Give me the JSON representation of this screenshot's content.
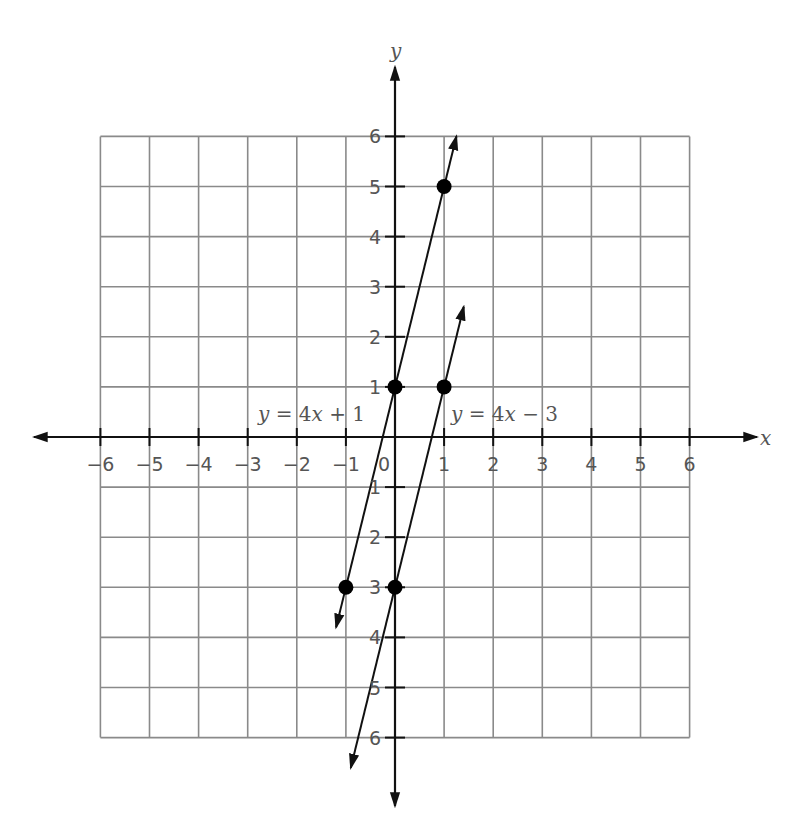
{
  "chart_data": {
    "type": "line",
    "title": "",
    "xlabel": "x",
    "ylabel": "y",
    "xlim": [
      -6,
      6
    ],
    "ylim": [
      -6,
      6
    ],
    "grid": true,
    "x_ticks": [
      -6,
      -5,
      -4,
      -3,
      -2,
      -1,
      0,
      1,
      2,
      3,
      4,
      5,
      6
    ],
    "x_tick_labels": [
      "−6",
      "−5",
      "−4",
      "−3",
      "−2",
      "−1",
      "0",
      "1",
      "2",
      "3",
      "4",
      "5",
      "6"
    ],
    "y_ticks": [
      6,
      5,
      4,
      3,
      2,
      1,
      -1,
      -2,
      -3,
      -4,
      -5,
      -6
    ],
    "y_tick_labels": [
      "6",
      "5",
      "4",
      "3",
      "2",
      "1",
      "1",
      "2",
      "3",
      "4",
      "5",
      "6"
    ],
    "series": [
      {
        "name": "y = 4x + 1",
        "equation": "y = 4x + 1",
        "slope": 4,
        "intercept": 1,
        "points": [
          [
            -1,
            -3
          ],
          [
            0,
            1
          ],
          [
            1,
            5
          ]
        ],
        "x_range": [
          -1.2,
          1.25
        ],
        "label_position": [
          -2.75,
          0.45
        ]
      },
      {
        "name": "y = 4x − 3",
        "equation": "y = 4x − 3",
        "slope": 4,
        "intercept": -3,
        "points": [
          [
            0,
            -3
          ],
          [
            1,
            1
          ]
        ],
        "x_range": [
          -0.9,
          1.4
        ],
        "label_position": [
          1.15,
          0.45
        ]
      }
    ],
    "legend": null,
    "annotations": [
      "y = 4x + 1",
      "y = 4x − 3"
    ]
  },
  "labels": {
    "x_axis": "x",
    "y_axis": "y",
    "line1_prefix": "y",
    "line1_mid": " = 4",
    "line1_var": "x",
    "line1_suffix": " + 1",
    "line2_prefix": "y",
    "line2_mid": " = 4",
    "line2_var": "x",
    "line2_suffix": " − 3"
  },
  "colors": {
    "grid": "#8a8a8a",
    "axis": "#111111",
    "line": "#111111",
    "text": "#555555",
    "point": "#000000"
  }
}
